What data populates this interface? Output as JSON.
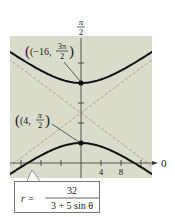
{
  "chart_data": {
    "type": "line",
    "title": "",
    "coordinate_system": "polar",
    "equation": {
      "lhs": "r =",
      "numerator": "32",
      "denominator": "3 + 5 sin θ"
    },
    "curve": "hyperbola",
    "eccentricity": 1.6667,
    "directrix": "y = 32/5",
    "vertices": [
      {
        "label_r": "(−16,",
        "label_theta_num": "3π",
        "label_theta_den": "2",
        "r": -16,
        "theta": "3π/2",
        "x": 0,
        "y": 16
      },
      {
        "label_r": "(4,",
        "label_theta_num": "π",
        "label_theta_den": "2",
        "r": 4,
        "theta": "π/2",
        "x": 0,
        "y": 4
      }
    ],
    "center": {
      "x": 0,
      "y": 10
    },
    "a": 6,
    "b": 8,
    "c": 10,
    "asymptotes": [
      {
        "slope": 0.75,
        "intercept": 10,
        "style": "dashed"
      },
      {
        "slope": -0.75,
        "intercept": 10,
        "style": "dashed"
      }
    ],
    "polar_axis_label": "0",
    "vertical_axis_label_num": "π",
    "vertical_axis_label_den": "2",
    "x_tick_labels": [
      "4",
      "8"
    ],
    "x_ticks": [
      -12,
      -8,
      -4,
      4,
      8,
      12
    ],
    "y_ticks": [
      4,
      8,
      12,
      16,
      20
    ],
    "xlim": [
      -14,
      14
    ],
    "ylim": [
      -3,
      25
    ],
    "grid": false,
    "colors": {
      "background": "#d9dccb",
      "curve": "#111111",
      "asymptote": "#c49a8c",
      "axis": "#333333"
    }
  }
}
